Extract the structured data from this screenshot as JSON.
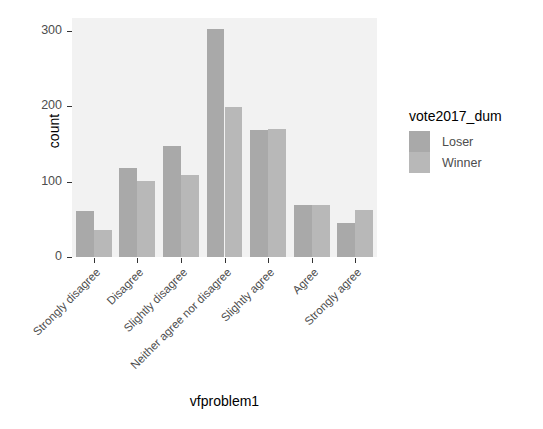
{
  "chart_data": {
    "type": "bar",
    "title": "",
    "subtitle": "",
    "xlabel": "vfproblem1",
    "ylabel": "count",
    "categories": [
      "Strongly disagree",
      "Disagree",
      "Slightly disagree",
      "Neither agree nor disagree",
      "Slightly agree",
      "Agree",
      "Strongly agree"
    ],
    "series": [
      {
        "name": "Loser",
        "color": "#a9a9a9",
        "values": [
          61,
          118,
          147,
          303,
          168,
          69,
          45
        ]
      },
      {
        "name": "Winner",
        "color": "#b8b8b8",
        "values": [
          36,
          101,
          109,
          199,
          170,
          69,
          63
        ]
      }
    ],
    "ylim": [
      0,
      317
    ],
    "yticks": [
      0,
      100,
      200,
      300
    ],
    "ytick_labels": [
      "0",
      "100",
      "200",
      "300"
    ],
    "grid": false,
    "legend_position": "right",
    "legend_title": "vote2017_dum",
    "panel_background": "#f2f2f2",
    "axis_text_color": "#4d4d4d",
    "axis_title_color": "#000000",
    "x_tick_label_angle": -45
  }
}
